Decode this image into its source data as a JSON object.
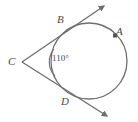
{
  "figure": {
    "type": "geometry-diagram",
    "stroke_color": "#6e6e6e",
    "label_color": "#4a4a4a",
    "background_color": "#ffffff",
    "width": 138,
    "height": 122
  },
  "labels": {
    "point_a": "A",
    "point_b": "B",
    "point_c": "C",
    "point_d": "D",
    "angle_measure": "110°"
  },
  "geometry": {
    "circle": {
      "cx": 89,
      "cy": 61,
      "r": 38
    },
    "external_point": {
      "x": 22,
      "y": 62
    },
    "tangent_point_b": {
      "x": 62,
      "y": 27
    },
    "tangent_point_d": {
      "x": 68,
      "y": 95
    },
    "marked_point_a": {
      "x": 116,
      "y": 36
    },
    "ray_b_end": {
      "x": 106,
      "y": 5
    },
    "ray_d_end": {
      "x": 109,
      "y": 117
    },
    "angle_arc_radius": 15
  }
}
